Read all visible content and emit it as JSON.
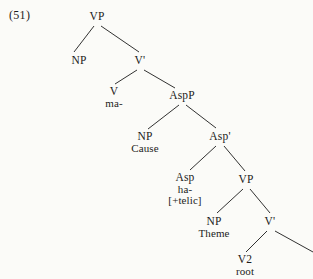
{
  "figure": {
    "example_number": "(51)",
    "type": "syntactic-tree",
    "ink_color": "#1b1b1b",
    "background_color": "#fbfbf8"
  },
  "tree": {
    "nodes": [
      {
        "id": "vp-top",
        "label": "VP",
        "sub": "",
        "sub2": "",
        "x": 97,
        "y": 11
      },
      {
        "id": "np-spec",
        "label": "NP",
        "sub": "",
        "sub2": "",
        "x": 79,
        "y": 55
      },
      {
        "id": "vbar-top",
        "label": "V'",
        "sub": "",
        "sub2": "",
        "x": 140,
        "y": 55
      },
      {
        "id": "v-head",
        "label": "V",
        "sub": "ma-",
        "sub2": "",
        "x": 114,
        "y": 86
      },
      {
        "id": "aspp",
        "label": "AspP",
        "sub": "",
        "sub2": "",
        "x": 182,
        "y": 90
      },
      {
        "id": "np-cause",
        "label": "NP",
        "sub": "Cause",
        "sub2": "",
        "x": 145,
        "y": 131
      },
      {
        "id": "aspbar",
        "label": "Asp'",
        "sub": "",
        "sub2": "",
        "x": 220,
        "y": 131
      },
      {
        "id": "asp-head",
        "label": "Asp",
        "sub": "ha-",
        "sub2": "[+telic]",
        "x": 185,
        "y": 172
      },
      {
        "id": "vp-low",
        "label": "VP",
        "sub": "",
        "sub2": "",
        "x": 246,
        "y": 174
      },
      {
        "id": "np-theme",
        "label": "NP",
        "sub": "Theme",
        "sub2": "",
        "x": 214,
        "y": 216
      },
      {
        "id": "vbar-low",
        "label": "V'",
        "sub": "",
        "sub2": "",
        "x": 270,
        "y": 216
      },
      {
        "id": "v2-root",
        "label": "V2",
        "sub": "root",
        "sub2": "",
        "x": 245,
        "y": 254
      }
    ],
    "branches": [
      {
        "id": "vp-top-to-np-spec",
        "x1": 94,
        "y1": 26,
        "x2": 74,
        "y2": 52
      },
      {
        "id": "vp-top-to-vbar",
        "x1": 101,
        "y1": 26,
        "x2": 139,
        "y2": 52
      },
      {
        "id": "vbar-to-v",
        "x1": 137,
        "y1": 70,
        "x2": 115,
        "y2": 84
      },
      {
        "id": "vbar-to-aspp",
        "x1": 144,
        "y1": 70,
        "x2": 175,
        "y2": 88
      },
      {
        "id": "aspp-to-np-cause",
        "x1": 179,
        "y1": 105,
        "x2": 148,
        "y2": 129
      },
      {
        "id": "aspp-to-aspbar",
        "x1": 186,
        "y1": 105,
        "x2": 216,
        "y2": 128
      },
      {
        "id": "aspbar-to-asp",
        "x1": 216,
        "y1": 146,
        "x2": 190,
        "y2": 170
      },
      {
        "id": "aspbar-to-vp-low",
        "x1": 224,
        "y1": 146,
        "x2": 245,
        "y2": 171
      },
      {
        "id": "vp-low-to-np-theme",
        "x1": 243,
        "y1": 189,
        "x2": 217,
        "y2": 213
      },
      {
        "id": "vp-low-to-vbar-low",
        "x1": 250,
        "y1": 189,
        "x2": 270,
        "y2": 213
      },
      {
        "id": "vbar-low-to-v2",
        "x1": 267,
        "y1": 231,
        "x2": 246,
        "y2": 252
      },
      {
        "id": "vbar-low-to-right",
        "x1": 275,
        "y1": 231,
        "x2": 313,
        "y2": 252
      }
    ]
  }
}
